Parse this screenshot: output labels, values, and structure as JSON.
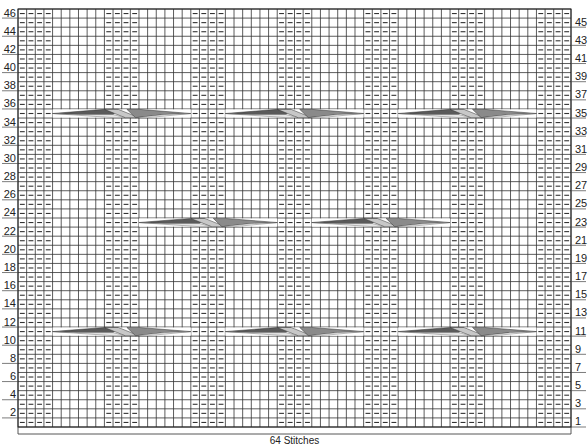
{
  "chart_data": {
    "type": "knitting-chart",
    "stitch_count": 64,
    "row_count": 46,
    "footer_label": "64 Stitches",
    "column_pattern": {
      "description": "P4, K6 repeated; ends with P4",
      "purl_column_groups": [
        [
          0,
          3
        ],
        [
          10,
          13
        ],
        [
          20,
          23
        ],
        [
          30,
          33
        ],
        [
          40,
          43
        ],
        [
          50,
          53
        ],
        [
          60,
          63
        ]
      ]
    },
    "left_row_labels": [
      46,
      44,
      42,
      40,
      38,
      36,
      34,
      32,
      30,
      28,
      26,
      24,
      22,
      20,
      18,
      16,
      14,
      12,
      10,
      8,
      6,
      4,
      2
    ],
    "right_row_labels": [
      45,
      43,
      41,
      39,
      37,
      35,
      33,
      31,
      29,
      27,
      25,
      23,
      21,
      19,
      17,
      15,
      13,
      11,
      9,
      7,
      5,
      3,
      1
    ],
    "cables": [
      {
        "row": 35,
        "start_col": 4,
        "width": 16
      },
      {
        "row": 35,
        "start_col": 24,
        "width": 16
      },
      {
        "row": 35,
        "start_col": 44,
        "width": 16
      },
      {
        "row": 23,
        "start_col": 14,
        "width": 16
      },
      {
        "row": 23,
        "start_col": 34,
        "width": 16
      },
      {
        "row": 11,
        "start_col": 4,
        "width": 16
      },
      {
        "row": 11,
        "start_col": 24,
        "width": 16
      },
      {
        "row": 11,
        "start_col": 44,
        "width": 16
      }
    ],
    "symbols": {
      "knit": "empty square",
      "purl": "horizontal dash",
      "cable": "16-stitch crossed cable"
    },
    "colors": {
      "grid_line": "#333333",
      "cable_dark": "#5a5a5a",
      "cable_mid": "#8a8a8a",
      "cable_light": "#c8c8c8"
    }
  }
}
